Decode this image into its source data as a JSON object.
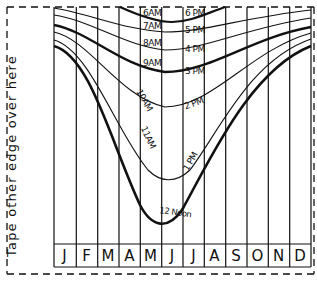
{
  "tape_instruction": "Tape other edge over here",
  "months": [
    "J",
    "F",
    "M",
    "A",
    "M",
    "J",
    "J",
    "A",
    "S",
    "O",
    "N",
    "D"
  ],
  "morning_labels": [
    {
      "label": "6AM",
      "x": 143,
      "y": 8
    },
    {
      "label": "7AM",
      "x": 143,
      "y": 21
    },
    {
      "label": "8AM",
      "x": 143,
      "y": 38
    },
    {
      "label": "9AM",
      "x": 143,
      "y": 58
    },
    {
      "label": "10AM",
      "x": 142,
      "y": 88,
      "rot": 60
    },
    {
      "label": "11AM",
      "x": 140,
      "y": 125,
      "rot": 65
    }
  ],
  "afternoon_labels": [
    {
      "label": "6 PM",
      "x": 185,
      "y": 8
    },
    {
      "label": "5 PM",
      "x": 185,
      "y": 25
    },
    {
      "label": "4 PM",
      "x": 185,
      "y": 44
    },
    {
      "label": "3 PM",
      "x": 185,
      "y": 66
    },
    {
      "label": "2 PM",
      "x": 183,
      "y": 98,
      "rot": -20
    },
    {
      "label": "1 PM",
      "x": 179,
      "y": 160,
      "rot": -60
    }
  ],
  "noon_label": "12 Noon",
  "colors": {
    "ink": "#111111",
    "paper": "#ffffff"
  }
}
